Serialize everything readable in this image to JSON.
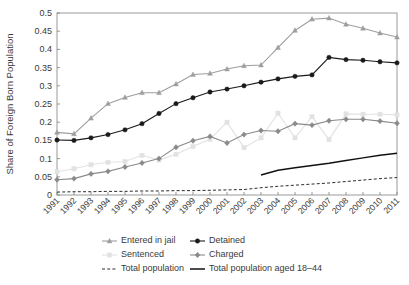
{
  "chart_data": {
    "type": "line",
    "title": "",
    "xlabel": "",
    "ylabel": "Share of Foreign Born Population",
    "xlim": [
      1991,
      2011
    ],
    "ylim": [
      0,
      0.5
    ],
    "ytick_labels": [
      "0",
      "0.05",
      "0.1",
      "0.15",
      "0.2",
      "0.25",
      "0.3",
      "0.35",
      "0.4",
      "0.45",
      "0.5"
    ],
    "ytick_values": [
      0,
      0.05,
      0.1,
      0.15,
      0.2,
      0.25,
      0.3,
      0.35,
      0.4,
      0.45,
      0.5
    ],
    "grid": false,
    "legend_position": "below",
    "x": [
      1991,
      1992,
      1993,
      1994,
      1995,
      1996,
      1997,
      1998,
      1999,
      2000,
      2001,
      2002,
      2003,
      2004,
      2005,
      2006,
      2007,
      2008,
      2009,
      2010,
      2011
    ],
    "xtick_labels": [
      "1991",
      "1992",
      "1993",
      "1994",
      "1995",
      "1996",
      "1997",
      "1998",
      "1999",
      "2000",
      "2001",
      "2002",
      "2003",
      "2004",
      "2005",
      "2006",
      "2007",
      "2008",
      "2009",
      "2010",
      "2011"
    ],
    "series": [
      {
        "name": "Entered in jail",
        "color": "#9e9e9e",
        "marker": "triangle",
        "style": "solid",
        "values": [
          0.172,
          0.168,
          0.211,
          0.251,
          0.268,
          0.281,
          0.281,
          0.305,
          0.331,
          0.334,
          0.346,
          0.355,
          0.357,
          0.405,
          0.452,
          0.483,
          0.486,
          0.469,
          0.458,
          0.445,
          0.434
        ]
      },
      {
        "name": "Detained",
        "color": "#1a1a1a",
        "marker": "circle",
        "style": "solid",
        "values": [
          0.151,
          0.15,
          0.157,
          0.166,
          0.179,
          0.196,
          0.224,
          0.251,
          0.267,
          0.283,
          0.291,
          0.3,
          0.31,
          0.319,
          0.326,
          0.33,
          0.378,
          0.372,
          0.37,
          0.366,
          0.363
        ]
      },
      {
        "name": "Sentenced",
        "color": "#e2e2e2",
        "marker": "square",
        "style": "solid",
        "values": [
          0.064,
          0.072,
          0.083,
          0.09,
          0.092,
          0.109,
          0.096,
          0.112,
          0.133,
          0.153,
          0.2,
          0.13,
          0.157,
          0.225,
          0.157,
          0.215,
          0.152,
          0.223,
          0.222,
          0.222,
          0.22
        ]
      },
      {
        "name": "Charged",
        "color": "#8a8a8a",
        "marker": "diamond",
        "style": "solid",
        "values": [
          0.042,
          0.045,
          0.058,
          0.065,
          0.077,
          0.088,
          0.1,
          0.131,
          0.149,
          0.161,
          0.143,
          0.166,
          0.177,
          0.175,
          0.196,
          0.192,
          0.204,
          0.208,
          0.208,
          0.203,
          0.197
        ]
      },
      {
        "name": "Total population",
        "color": "#2b2b2b",
        "marker": "none",
        "style": "dashed",
        "values": [
          0.008,
          0.009,
          0.009,
          0.01,
          0.01,
          0.011,
          0.011,
          0.012,
          0.012,
          0.013,
          0.014,
          0.015,
          0.02,
          0.024,
          0.027,
          0.03,
          0.033,
          0.037,
          0.041,
          0.045,
          0.048
        ]
      },
      {
        "name": "Total population aged 18–44",
        "color": "#111111",
        "marker": "none",
        "style": "solid-thick",
        "values": [
          null,
          null,
          null,
          null,
          null,
          null,
          null,
          null,
          null,
          null,
          null,
          null,
          0.055,
          0.068,
          0.075,
          0.081,
          0.087,
          0.095,
          0.102,
          0.109,
          0.115
        ]
      }
    ],
    "legend": [
      {
        "label": "Entered in jail",
        "color": "#9e9e9e",
        "marker": "triangle",
        "style": "solid"
      },
      {
        "label": "Detained",
        "color": "#1a1a1a",
        "marker": "circle",
        "style": "solid"
      },
      {
        "label": "Sentenced",
        "color": "#e2e2e2",
        "marker": "square",
        "style": "solid"
      },
      {
        "label": "Charged",
        "color": "#8a8a8a",
        "marker": "diamond",
        "style": "solid"
      },
      {
        "label": "Total population",
        "color": "#2b2b2b",
        "marker": "none",
        "style": "dashed"
      },
      {
        "label": "Total population aged 18–44",
        "color": "#111111",
        "marker": "none",
        "style": "solid-thick"
      }
    ]
  }
}
